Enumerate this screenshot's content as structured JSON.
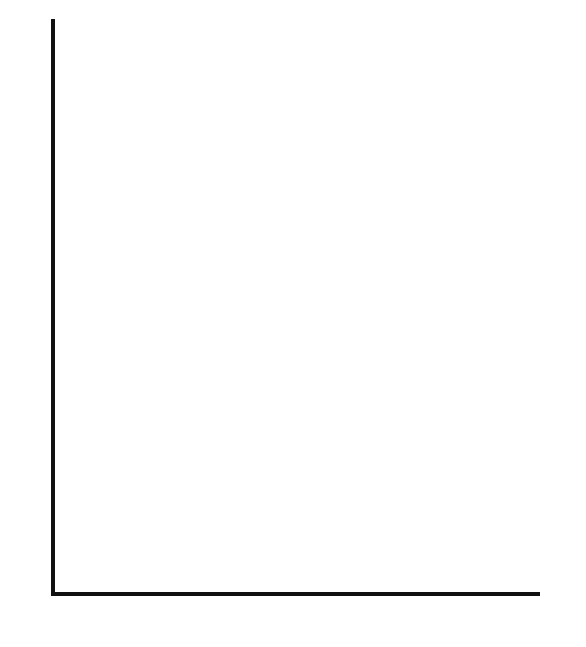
{
  "diagram": {
    "type": "coordinate-grid-picture",
    "x_axis": {
      "min": 0,
      "max": 13,
      "ticks": [
        "1",
        "2",
        "3",
        "4",
        "5",
        "6",
        "7",
        "8",
        "9",
        "10",
        "11",
        "12",
        "13"
      ]
    },
    "y_axis": {
      "min": 0,
      "max": 14,
      "ticks": [
        "0",
        "1",
        "2",
        "3",
        "4",
        "5",
        "6",
        "7",
        "8",
        "9",
        "10",
        "11",
        "12",
        "13",
        "14"
      ]
    },
    "axis_label_partial": "y",
    "colors": {
      "dark": "#6f6f6f",
      "light": "#d3d3d3",
      "grid": "#a6a6a6",
      "axis": "#111111"
    },
    "dark_points": [
      [
        6,
        14
      ],
      [
        7,
        14
      ],
      [
        8,
        14
      ],
      [
        4,
        13
      ],
      [
        5,
        13
      ],
      [
        6,
        13
      ],
      [
        7,
        13
      ],
      [
        8,
        13
      ],
      [
        9,
        13
      ],
      [
        10,
        13
      ],
      [
        6,
        12
      ],
      [
        7,
        12
      ],
      [
        8,
        12
      ],
      [
        6,
        11
      ],
      [
        7,
        11
      ],
      [
        8,
        11
      ],
      [
        6,
        10
      ],
      [
        7,
        10
      ],
      [
        8,
        10
      ],
      [
        6,
        9
      ],
      [
        7,
        9
      ],
      [
        8,
        9
      ],
      [
        6,
        8
      ],
      [
        7,
        8
      ],
      [
        8,
        8
      ],
      [
        6,
        7
      ],
      [
        7,
        7
      ],
      [
        8,
        7
      ],
      [
        5,
        6
      ],
      [
        6,
        6
      ],
      [
        7,
        6
      ],
      [
        8,
        6
      ],
      [
        9,
        6
      ],
      [
        5,
        5
      ],
      [
        6,
        5
      ],
      [
        7,
        5
      ],
      [
        8,
        5
      ],
      [
        9,
        5
      ],
      [
        5,
        4
      ],
      [
        6,
        4
      ],
      [
        8,
        4
      ],
      [
        9,
        4
      ]
    ],
    "light_points": [
      [
        4,
        10
      ],
      [
        5,
        10
      ],
      [
        9,
        10
      ],
      [
        10,
        10
      ],
      [
        4,
        9
      ],
      [
        10,
        9
      ],
      [
        4,
        8
      ],
      [
        10,
        8
      ],
      [
        4,
        4
      ],
      [
        10,
        4
      ],
      [
        4,
        3
      ],
      [
        10,
        3
      ],
      [
        4,
        2
      ],
      [
        10,
        2
      ],
      [
        2,
        1
      ],
      [
        3,
        1
      ],
      [
        4,
        1
      ],
      [
        10,
        1
      ],
      [
        11,
        1
      ],
      [
        12,
        1
      ]
    ]
  }
}
